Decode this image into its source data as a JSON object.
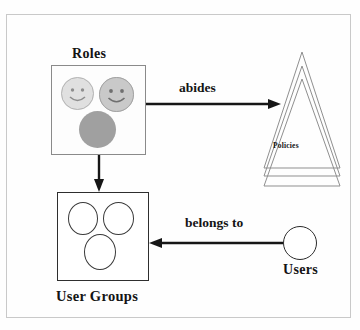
{
  "diagram": {
    "frame": {
      "visible": true,
      "border_color": "#c9c9c9"
    },
    "entities": {
      "roles": {
        "label": "Roles",
        "type": "container-box",
        "items": [
          {
            "name": "role-smiley-1",
            "shape": "circle",
            "style": "smiley",
            "fill": "#e0e0e0"
          },
          {
            "name": "role-smiley-2",
            "shape": "circle",
            "style": "smiley",
            "fill": "#c9c9c9"
          },
          {
            "name": "role-filled-3",
            "shape": "circle",
            "style": "solid",
            "fill": "#a0a0a0"
          }
        ]
      },
      "user_groups": {
        "label": "User Groups",
        "type": "container-box",
        "items": [
          {
            "name": "group-ellipse-1",
            "shape": "ellipse",
            "style": "outline"
          },
          {
            "name": "group-ellipse-2",
            "shape": "ellipse",
            "style": "outline"
          },
          {
            "name": "group-ellipse-3",
            "shape": "ellipse",
            "style": "outline"
          }
        ]
      },
      "policies": {
        "label": "Policies",
        "type": "stacked-triangles",
        "count": 3,
        "stroke": "#8f8f8f"
      },
      "users": {
        "label": "Users",
        "type": "circle",
        "stroke": "#2b2b2b"
      }
    },
    "relations": [
      {
        "name": "abides",
        "label": "abides",
        "from": "roles",
        "to": "policies",
        "direction": "right"
      },
      {
        "name": "contains",
        "label": "",
        "from": "roles",
        "to": "user_groups",
        "direction": "down"
      },
      {
        "name": "belongs-to",
        "label": "belongs to",
        "from": "users",
        "to": "user_groups",
        "direction": "left"
      }
    ],
    "colors": {
      "ink": "#161616",
      "frame": "#c9c9c9",
      "triangle_stroke": "#8f8f8f"
    }
  }
}
